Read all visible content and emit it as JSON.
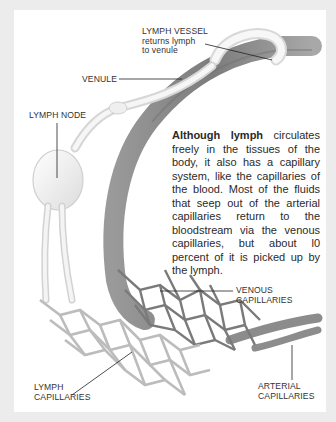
{
  "labels": {
    "lymph_vessel": {
      "title": "LYMPH VESSEL",
      "sub1": "returns lymph",
      "sub2": "to venule"
    },
    "venule": "VENULE",
    "lymph_node": "LYMPH NODE",
    "venous_capillaries": {
      "line1": "VENOUS",
      "line2": "CAPILLARIES"
    },
    "lymph_capillaries": {
      "line1": "LYMPH",
      "line2": "CAPILLARIES"
    },
    "arterial_capillaries": {
      "line1": "ARTERIAL",
      "line2": "CAPILLARIES"
    }
  },
  "caption": {
    "lead_bold": "Although lymph",
    "text": " circulates freely in the tissues of the body, it also has a capillary system, like the capillaries of the blood. Most of the fluids that seep out of the arterial capillaries return to the bloodstream via the venous capillaries, but about l0 percent of it is picked up by the lymph."
  },
  "colors": {
    "frame": "#ececec",
    "panel": "#ffffff",
    "venule": "#8a8a8a",
    "lymph": "#f0f0f0",
    "text": "#333333"
  }
}
